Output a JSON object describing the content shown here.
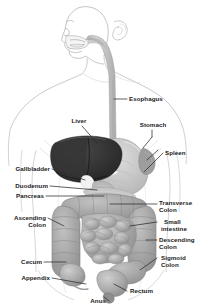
{
  "figure": {
    "background_color": "#ffffff",
    "outline_color": "#b9b9b9",
    "label_color": "#1a1a1a",
    "leader_color": "#2b2b2b",
    "width": 211,
    "height": 308
  },
  "palette": {
    "liver": "#2e2e2e",
    "stomach": "#c9c9c9",
    "intestine": "#a8a8a8",
    "esophagus": "#c4c4c4",
    "body_outline": "#c3c3c3",
    "skin": "#fdfdfd"
  },
  "labels": {
    "esophagus": "Esophagus",
    "stomach": "Stomach",
    "liver": "Liver",
    "spleen": "Spleen",
    "gallbladder": "Gallbladder",
    "duodenum": "Duodenum",
    "pancreas": "Pancreas",
    "transverse_colon_l1": "Transverse",
    "transverse_colon_l2": "Colon",
    "small_intestine_l1": "Small",
    "small_intestine_l2": "intestine",
    "descending_colon_l1": "Descending",
    "descending_colon_l2": "Colon",
    "sigmoid_colon_l1": "Sigmoid",
    "sigmoid_colon_l2": "Colon",
    "ascending_colon_l1": "Ascending",
    "ascending_colon_l2": "Colon",
    "cecum": "Cecum",
    "appendix": "Appendix",
    "rectum": "Rectum",
    "anus": "Anus"
  },
  "organs": [
    {
      "name": "esophagus",
      "label": "Esophagus",
      "side": "right"
    },
    {
      "name": "stomach",
      "label": "Stomach",
      "side": "right"
    },
    {
      "name": "liver",
      "label": "Liver",
      "side": "left"
    },
    {
      "name": "spleen",
      "label": "Spleen",
      "side": "right"
    },
    {
      "name": "gallbladder",
      "label": "Gallbladder",
      "side": "left"
    },
    {
      "name": "duodenum",
      "label": "Duodenum",
      "side": "left"
    },
    {
      "name": "pancreas",
      "label": "Pancreas",
      "side": "left"
    },
    {
      "name": "transverse-colon",
      "label": "Transverse Colon",
      "side": "right"
    },
    {
      "name": "small-intestine",
      "label": "Small intestine",
      "side": "right"
    },
    {
      "name": "descending-colon",
      "label": "Descending Colon",
      "side": "right"
    },
    {
      "name": "sigmoid-colon",
      "label": "Sigmoid Colon",
      "side": "right"
    },
    {
      "name": "ascending-colon",
      "label": "Ascending Colon",
      "side": "left"
    },
    {
      "name": "cecum",
      "label": "Cecum",
      "side": "left"
    },
    {
      "name": "appendix",
      "label": "Appendix",
      "side": "left"
    },
    {
      "name": "rectum",
      "label": "Rectum",
      "side": "right"
    },
    {
      "name": "anus",
      "label": "Anus",
      "side": "left"
    }
  ]
}
